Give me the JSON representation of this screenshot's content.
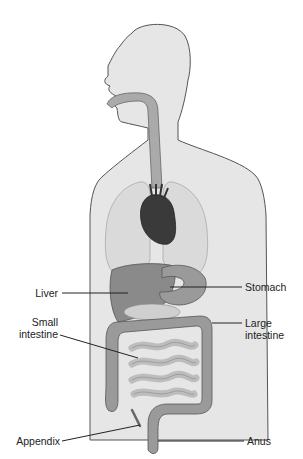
{
  "diagram": {
    "labels": {
      "liver": "Liver",
      "small_intestine_1": "Small",
      "small_intestine_2": "intestine",
      "appendix": "Appendix",
      "stomach": "Stomach",
      "large_intestine_1": "Large",
      "large_intestine_2": "intestine",
      "anus": "Anus"
    },
    "colors": {
      "body": "#e6e6e6",
      "outline": "#555555",
      "lungs": "#dadada",
      "heart": "#3a3a3a",
      "organs": "#8a8a8a",
      "intestine": "#9a9a9a",
      "small_intestine": "#b8b8b8"
    }
  }
}
